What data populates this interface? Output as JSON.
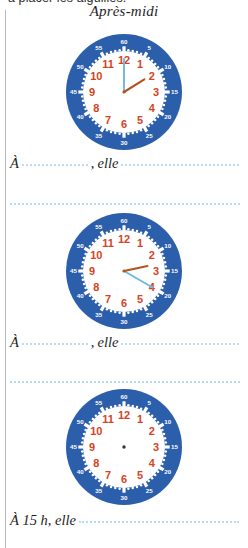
{
  "worksheet": {
    "top_cropped_line": "a placer les aiguilles.",
    "heading": "Après-midi",
    "accent_blue": "#2b5eab",
    "hour_number_color": "#d4441e",
    "minute_number_color": "#ffffff",
    "hour_hand_color": "#b5531f",
    "minute_hand_color": "#6fb7e0",
    "dotted_line_color": "#b9dcef"
  },
  "items": [
    {
      "clock": {
        "name": "clock-1",
        "hour_numbers": [
          "1",
          "2",
          "3",
          "4",
          "5",
          "6",
          "7",
          "8",
          "9",
          "10",
          "11",
          "12"
        ],
        "minute_numbers": [
          "5",
          "10",
          "15",
          "20",
          "25",
          "30",
          "35",
          "40",
          "45",
          "50",
          "55",
          "60"
        ],
        "hour_hand_angle_deg": 58,
        "minute_hand_angle_deg": 0,
        "hands_drawn": true
      },
      "sentence": {
        "prefix": "À",
        "blank_time": "",
        "comma": ",",
        "middle": "elle",
        "blank_activity": ""
      }
    },
    {
      "clock": {
        "name": "clock-2",
        "hour_numbers": [
          "1",
          "2",
          "3",
          "4",
          "5",
          "6",
          "7",
          "8",
          "9",
          "10",
          "11",
          "12"
        ],
        "minute_numbers": [
          "5",
          "10",
          "15",
          "20",
          "25",
          "30",
          "35",
          "40",
          "45",
          "50",
          "55",
          "60"
        ],
        "hour_hand_angle_deg": 78,
        "minute_hand_angle_deg": 120,
        "hands_drawn": true
      },
      "sentence": {
        "prefix": "À",
        "blank_time": "",
        "comma": ",",
        "middle": "elle",
        "blank_activity": ""
      }
    },
    {
      "clock": {
        "name": "clock-3",
        "hour_numbers": [
          "1",
          "2",
          "3",
          "4",
          "5",
          "6",
          "7",
          "8",
          "9",
          "10",
          "11",
          "12"
        ],
        "minute_numbers": [
          "5",
          "10",
          "15",
          "20",
          "25",
          "30",
          "35",
          "40",
          "45",
          "50",
          "55",
          "60"
        ],
        "hour_hand_angle_deg": null,
        "minute_hand_angle_deg": null,
        "hands_drawn": false
      },
      "sentence": {
        "prefix": "À 15 h, elle",
        "blank_activity": ""
      }
    }
  ]
}
